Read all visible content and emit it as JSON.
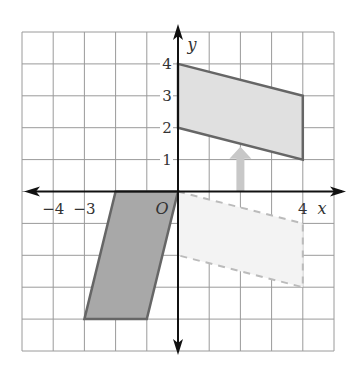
{
  "axes": {
    "x_label": "x",
    "y_label": "y",
    "origin_label": "O",
    "x_ticks": [
      {
        "value": -4,
        "label": "−4"
      },
      {
        "value": -3,
        "label": "−3"
      },
      {
        "value": 4,
        "label": "4"
      }
    ],
    "y_ticks": [
      {
        "value": 1,
        "label": "1"
      },
      {
        "value": 2,
        "label": "2"
      },
      {
        "value": 3,
        "label": "3"
      },
      {
        "value": 4,
        "label": "4"
      }
    ],
    "grid": {
      "xmin": -5,
      "xmax": 5,
      "ymin": -5,
      "ymax": 5
    }
  },
  "shapes": {
    "image": {
      "vertices": [
        [
          0,
          4
        ],
        [
          4,
          3
        ],
        [
          4,
          1
        ],
        [
          0,
          2
        ]
      ],
      "fill": "#e0e0e0",
      "stroke": "#666666",
      "style": "solid"
    },
    "preimage_sheared": {
      "vertices": [
        [
          -2,
          0
        ],
        [
          0,
          0
        ],
        [
          -1,
          -4
        ],
        [
          -3,
          -4
        ]
      ],
      "fill": "#a8a8a8",
      "stroke": "#666666",
      "style": "solid"
    },
    "intermediate": {
      "vertices": [
        [
          0,
          0
        ],
        [
          4,
          -1
        ],
        [
          4,
          -3
        ],
        [
          0,
          -2
        ]
      ],
      "fill": "#f3f3f3",
      "stroke": "#bbbbbb",
      "style": "dashed"
    }
  },
  "arrow": {
    "from": [
      2,
      0
    ],
    "to": [
      2,
      1.4
    ],
    "color": "#c8c8c8",
    "meaning": "translate up"
  }
}
